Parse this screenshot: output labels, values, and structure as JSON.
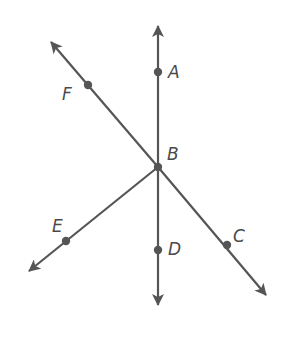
{
  "diagram": {
    "type": "rays-from-common-endpoint",
    "vertex": "B",
    "colors": {
      "line": "#555555",
      "point": "#555555",
      "label": "#4a4a4a",
      "background": "#ffffff"
    },
    "points": [
      {
        "id": "A",
        "label": "A",
        "x": 158,
        "y": 72
      },
      {
        "id": "B",
        "label": "B",
        "x": 158,
        "y": 167
      },
      {
        "id": "C",
        "label": "C",
        "x": 227,
        "y": 245
      },
      {
        "id": "D",
        "label": "D",
        "x": 158,
        "y": 250
      },
      {
        "id": "E",
        "label": "E",
        "x": 66,
        "y": 241
      },
      {
        "id": "F",
        "label": "F",
        "x": 88,
        "y": 85
      }
    ],
    "lines": [
      {
        "name": "line-AD",
        "through": [
          "A",
          "B",
          "D"
        ],
        "ends": "arrow-both"
      },
      {
        "name": "line-FC",
        "through": [
          "F",
          "B",
          "C"
        ],
        "ends": "arrow-both"
      },
      {
        "name": "ray-BE",
        "through": [
          "B",
          "E"
        ],
        "ends": "arrow-at-E"
      }
    ]
  },
  "labels": {
    "A": "A",
    "B": "B",
    "C": "C",
    "D": "D",
    "E": "E",
    "F": "F"
  }
}
